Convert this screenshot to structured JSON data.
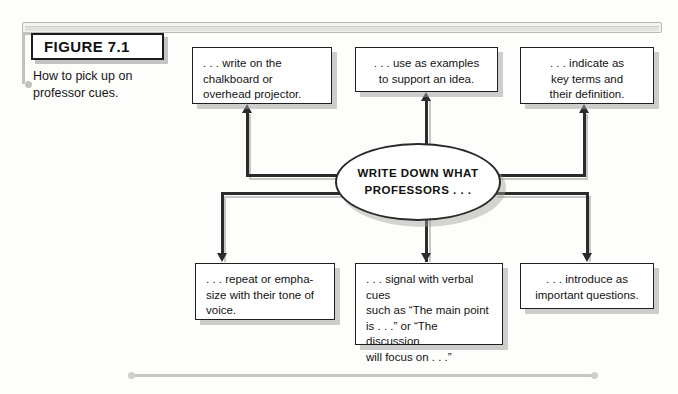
{
  "figure": {
    "label": "FIGURE 7.1",
    "caption": "How to pick up on professor cues."
  },
  "diagram": {
    "type": "hub-and-spoke flowchart",
    "hub": {
      "line1": "WRITE DOWN WHAT",
      "line2": "PROFESSORS . . ."
    },
    "nodes": [
      {
        "id": "chalkboard",
        "position": "top-left",
        "align": "left",
        "lines": [
          ". . . write on the",
          "chalkboard or",
          "overhead projector."
        ]
      },
      {
        "id": "examples",
        "position": "top-center",
        "align": "center",
        "lines": [
          ". . . use as examples",
          "to support an idea."
        ]
      },
      {
        "id": "key-terms",
        "position": "top-right",
        "align": "center",
        "lines": [
          ". . . indicate as",
          "key terms and",
          "their definition."
        ]
      },
      {
        "id": "tone",
        "position": "bottom-left",
        "align": "left",
        "lines": [
          ". . . repeat or empha-",
          "size with their tone of",
          "voice."
        ]
      },
      {
        "id": "verbal-cues",
        "position": "bottom-center",
        "align": "left",
        "lines": [
          ". . . signal with verbal cues",
          "such as “The main point",
          "is . . .” or “The discussion",
          "will focus on . . .”"
        ]
      },
      {
        "id": "questions",
        "position": "bottom-right",
        "align": "center",
        "lines": [
          ". . . introduce as",
          "important questions."
        ]
      }
    ],
    "connectors": [
      {
        "from": "hub",
        "to": "chalkboard",
        "style": "elbow",
        "direction": "up"
      },
      {
        "from": "hub",
        "to": "examples",
        "style": "straight",
        "direction": "up"
      },
      {
        "from": "hub",
        "to": "key-terms",
        "style": "elbow",
        "direction": "up"
      },
      {
        "from": "hub",
        "to": "tone",
        "style": "elbow",
        "direction": "down"
      },
      {
        "from": "hub",
        "to": "verbal-cues",
        "style": "straight",
        "direction": "down"
      },
      {
        "from": "hub",
        "to": "questions",
        "style": "elbow",
        "direction": "down"
      }
    ]
  },
  "colors": {
    "ink": "#1f1f1f",
    "shadow": "#9e9e9a",
    "rule": "#c7c7c2",
    "page": "#fdfdfc"
  }
}
